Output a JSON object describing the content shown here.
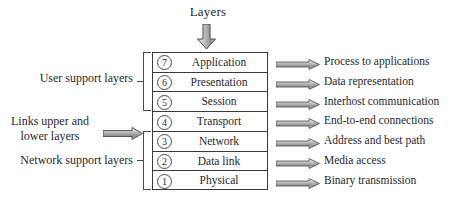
{
  "diagram": {
    "top_caption": "Layers",
    "top_arrow_icon": "down-block-arrow-icon",
    "layers": [
      {
        "number": "7",
        "name": "Application",
        "function": "Process to applications",
        "arrow_icon": "right-block-arrow-icon"
      },
      {
        "number": "6",
        "name": "Presentation",
        "function": "Data representation",
        "arrow_icon": "right-block-arrow-icon"
      },
      {
        "number": "5",
        "name": "Session",
        "function": "Interhost communication",
        "arrow_icon": "right-block-arrow-icon"
      },
      {
        "number": "4",
        "name": "Transport",
        "function": "End-to-end connections",
        "arrow_icon": "right-block-arrow-icon"
      },
      {
        "number": "3",
        "name": "Network",
        "function": "Address and best path",
        "arrow_icon": "right-block-arrow-icon"
      },
      {
        "number": "2",
        "name": "Data link",
        "function": "Media access",
        "arrow_icon": "right-block-arrow-icon"
      },
      {
        "number": "1",
        "name": "Physical",
        "function": "Binary transmission",
        "arrow_icon": "right-block-arrow-icon"
      }
    ],
    "groups": {
      "user_support": "User support layers",
      "links": "Links upper and\nlower layers",
      "links_line1": "Links upper and",
      "links_line2": "lower layers",
      "network_support": "Network support layers",
      "links_arrow_icon": "right-block-arrow-icon"
    },
    "colors": {
      "line": "#3a3a3a",
      "text": "#1f1f1f",
      "arrow_fill_light": "#e8e8e8",
      "arrow_fill_mid": "#9a9a9a",
      "arrow_outline": "#4a4a4a",
      "background": "#ffffff"
    }
  }
}
